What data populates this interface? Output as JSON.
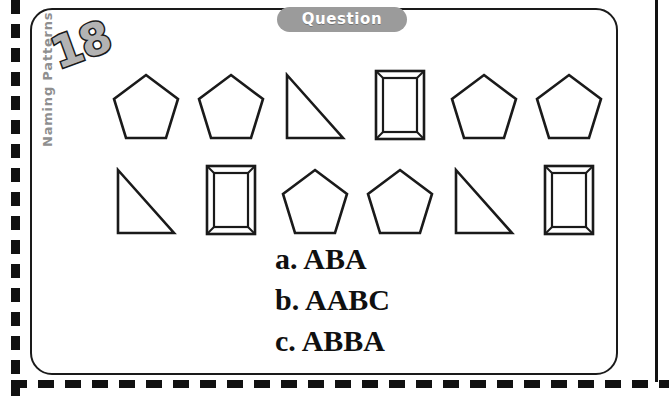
{
  "page": {
    "header_badge": "Question",
    "question_number": "18",
    "side_label": "Naming Patterns"
  },
  "shape_rows": [
    {
      "row_name": "row-1",
      "shapes": [
        "pentagon",
        "pentagon",
        "right-triangle",
        "framed-rectangle",
        "pentagon",
        "pentagon"
      ]
    },
    {
      "row_name": "row-2",
      "shapes": [
        "right-triangle",
        "framed-rectangle",
        "pentagon",
        "pentagon",
        "right-triangle",
        "framed-rectangle"
      ]
    }
  ],
  "answers": [
    {
      "key": "a.",
      "text": "ABA",
      "line": "a. ABA"
    },
    {
      "key": "b.",
      "text": "AABC",
      "line": "b. AABC"
    },
    {
      "key": "c.",
      "text": "ABBA",
      "line": "c. ABBA"
    }
  ],
  "colors": {
    "ink": "#1a1a1a",
    "pill_gray": "#9b9b9b",
    "pill_text": "#ffffff",
    "badge_fill": "#b3b3b3",
    "side_label_gray": "#8f8f8f",
    "paper": "#ffffff"
  }
}
